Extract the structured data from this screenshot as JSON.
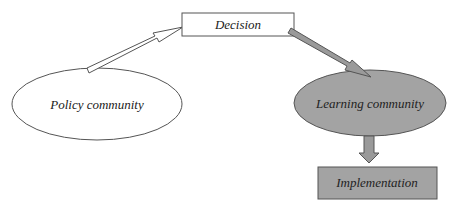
{
  "diagram": {
    "nodes": {
      "decision": {
        "label": "Decision",
        "fill": "#ffffff"
      },
      "policy": {
        "label": "Policy community",
        "fill": "#ffffff"
      },
      "learning": {
        "label": "Learning community",
        "fill": "#a3a3a3"
      },
      "implementation": {
        "label": "Implementation",
        "fill": "#a3a3a3"
      }
    },
    "edges": [
      {
        "from": "policy",
        "to": "decision",
        "style": "hollow-arrow"
      },
      {
        "from": "decision",
        "to": "learning",
        "style": "gray-arrow"
      },
      {
        "from": "learning",
        "to": "implementation",
        "style": "gray-block-arrow"
      }
    ],
    "colors": {
      "stroke": "#555555",
      "gray_fill": "#a3a3a3",
      "arrow_fill": "#9a9a9a"
    }
  }
}
